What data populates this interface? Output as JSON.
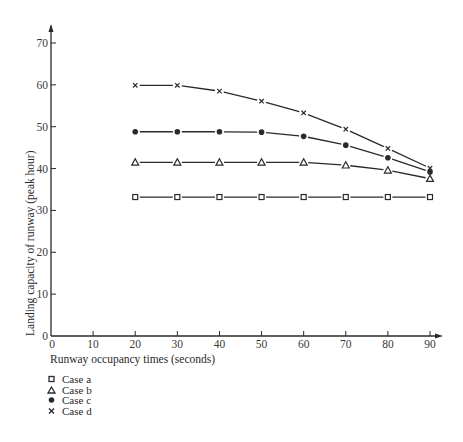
{
  "chart_data": {
    "type": "line",
    "title": "",
    "xlabel": "Runway occupancy times (seconds)",
    "ylabel": "Landing capacity of runway (peak hour)",
    "xlim": [
      0,
      90
    ],
    "ylim": [
      0,
      70
    ],
    "x_ticks": [
      0,
      10,
      20,
      30,
      40,
      50,
      60,
      70,
      80,
      90
    ],
    "y_ticks": [
      0,
      10,
      20,
      30,
      40,
      50,
      60,
      70
    ],
    "grid": false,
    "legend_position": "below-left",
    "x": [
      20,
      30,
      40,
      50,
      60,
      70,
      80,
      90
    ],
    "series": [
      {
        "name": "Case a",
        "marker": "square",
        "values": [
          33.2,
          33.2,
          33.2,
          33.2,
          33.2,
          33.2,
          33.2,
          33.2
        ]
      },
      {
        "name": "Case b",
        "marker": "triangle",
        "values": [
          41.5,
          41.5,
          41.5,
          41.5,
          41.5,
          40.8,
          39.6,
          37.6
        ]
      },
      {
        "name": "Case c",
        "marker": "dot",
        "values": [
          48.8,
          48.8,
          48.8,
          48.7,
          47.7,
          45.6,
          42.6,
          39.2
        ]
      },
      {
        "name": "Case d",
        "marker": "cross",
        "values": [
          59.9,
          59.9,
          58.5,
          56.1,
          53.3,
          49.4,
          44.8,
          40.1
        ]
      }
    ]
  },
  "legend": {
    "items": [
      {
        "label": "Case a",
        "marker": "square-icon"
      },
      {
        "label": "Case b",
        "marker": "triangle-icon"
      },
      {
        "label": "Case c",
        "marker": "dot-icon"
      },
      {
        "label": "Case d",
        "marker": "cross-icon"
      }
    ]
  },
  "style": {
    "ink": "#2a2a2a",
    "background": "#ffffff"
  }
}
